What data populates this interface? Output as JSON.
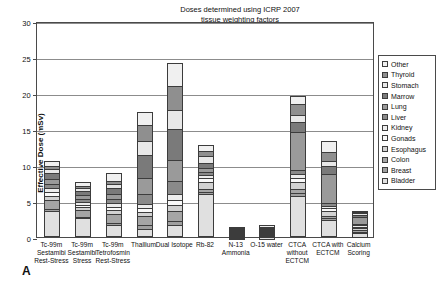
{
  "annotation": {
    "line1": "Doses determined using ICRP 2007",
    "line2": "tissue weighting factors"
  },
  "panel_letter": "A",
  "legend": {
    "items": [
      {
        "label": "Other",
        "color": "#f0f0f0"
      },
      {
        "label": "Thyroid",
        "color": "#8f8f8f"
      },
      {
        "label": "Stomach",
        "color": "#e8e8e8"
      },
      {
        "label": "Marrow",
        "color": "#7a7a7a"
      },
      {
        "label": "Lung",
        "color": "#9a9a9a"
      },
      {
        "label": "Liver",
        "color": "#8a8a8a"
      },
      {
        "label": "Kidney",
        "color": "#ededed"
      },
      {
        "label": "Gonads",
        "color": "#fafafa"
      },
      {
        "label": "Esophagus",
        "color": "#d2d2d2"
      },
      {
        "label": "Colon",
        "color": "#a5a5a5"
      },
      {
        "label": "Breast",
        "color": "#9f9f9f"
      },
      {
        "label": "Bladder",
        "color": "#e0e0e0"
      }
    ]
  },
  "chart_data": {
    "type": "bar",
    "subtype": "stacked-bar",
    "title": "",
    "xlabel": "",
    "ylabel": "Effective Dose (mSv)",
    "ylim": [
      0,
      30
    ],
    "yticks": [
      0,
      5,
      10,
      15,
      20,
      25,
      30
    ],
    "ytick_labels": [
      "0",
      "5",
      "10",
      "15",
      "20",
      "25",
      "30"
    ],
    "grid": true,
    "legend_position": "right-outside",
    "annotation": "Doses determined using ICRP 2007 tissue weighting factors",
    "categories": [
      "Tc-99m Sestamibi Rest-Stress",
      "Tc-99m Sestamibi Stress",
      "Tc-99m Tetrofosmin Rest-Stress",
      "Thallium",
      "Dual Isotope",
      "Rb-82",
      "N-13 Ammonia",
      "O-15 water",
      "CTCA without ECTCM",
      "CTCA with ECTCM",
      "Calcium Scoring"
    ],
    "category_labels": [
      [
        "Tc-99m",
        "Sestamibi",
        "Rest-Stress"
      ],
      [
        "Tc-99m",
        "Sestamibi",
        "Stress"
      ],
      [
        "Tc-99m",
        "Tetrofosmin",
        "Rest-Stress"
      ],
      [
        "Thallium"
      ],
      [
        "Dual Isotope"
      ],
      [
        "Rb-82"
      ],
      [
        "N-13",
        "Ammonia"
      ],
      [
        "O-15 water"
      ],
      [
        "CTCA",
        "without",
        "ECTCM"
      ],
      [
        "CTCA with",
        "ECTCM"
      ],
      [
        "Calcium",
        "Scoring"
      ]
    ],
    "totals": [
      10.6,
      7.7,
      8.9,
      17.3,
      24.1,
      12.8,
      1.4,
      1.5,
      19.6,
      13.4,
      3.6
    ],
    "series": [
      {
        "name": "Bladder",
        "color": "#e0e0e0",
        "values": [
          3.6,
          2.6,
          1.7,
          1.1,
          1.6,
          5.9,
          0.4,
          0.4,
          5.7,
          2.3,
          0.6
        ]
      },
      {
        "name": "Breast",
        "color": "#9f9f9f",
        "values": [
          0.3,
          0.2,
          0.3,
          0.5,
          0.6,
          0.3,
          0.1,
          0.1,
          0.4,
          0.3,
          0.2
        ]
      },
      {
        "name": "Colon",
        "color": "#a5a5a5",
        "values": [
          1.3,
          0.9,
          1.2,
          1.3,
          1.4,
          0.4,
          0.1,
          0.1,
          0.5,
          0.3,
          0.2
        ]
      },
      {
        "name": "Esophagus",
        "color": "#d2d2d2",
        "values": [
          0.5,
          0.4,
          0.5,
          0.6,
          0.8,
          1.1,
          0.1,
          0.1,
          1.1,
          0.7,
          0.3
        ]
      },
      {
        "name": "Gonads",
        "color": "#fafafa",
        "values": [
          0.6,
          0.4,
          0.5,
          0.5,
          0.7,
          0.5,
          0.1,
          0.1,
          0.5,
          0.4,
          0.2
        ]
      },
      {
        "name": "Kidney",
        "color": "#ededed",
        "values": [
          0.5,
          0.4,
          0.5,
          0.6,
          0.8,
          0.4,
          0.1,
          0.1,
          0.5,
          0.3,
          0.2
        ]
      },
      {
        "name": "Liver",
        "color": "#8a8a8a",
        "values": [
          0.6,
          0.4,
          0.6,
          1.4,
          1.9,
          0.4,
          0.1,
          0.1,
          0.6,
          0.4,
          0.2
        ]
      },
      {
        "name": "Lung",
        "color": "#9a9a9a",
        "values": [
          0.7,
          0.5,
          0.7,
          2.2,
          2.9,
          0.6,
          0.1,
          0.1,
          5.3,
          4.0,
          0.9
        ]
      },
      {
        "name": "Marrow",
        "color": "#7a7a7a",
        "values": [
          0.8,
          0.6,
          0.8,
          3.2,
          4.3,
          0.7,
          0.1,
          0.1,
          1.4,
          1.1,
          0.4
        ]
      },
      {
        "name": "Stomach",
        "color": "#e8e8e8",
        "values": [
          0.6,
          0.4,
          0.6,
          2.0,
          2.6,
          0.9,
          0.1,
          0.1,
          0.9,
          0.7,
          0.2
        ]
      },
      {
        "name": "Thyroid",
        "color": "#8f8f8f",
        "values": [
          0.4,
          0.3,
          0.4,
          2.1,
          3.4,
          0.8,
          0.05,
          0.1,
          1.6,
          1.3,
          0.1
        ]
      },
      {
        "name": "Other",
        "color": "#f0f0f0",
        "values": [
          0.7,
          0.6,
          1.1,
          1.8,
          3.1,
          0.8,
          0.1,
          0.2,
          1.1,
          1.6,
          0.1
        ]
      }
    ]
  }
}
